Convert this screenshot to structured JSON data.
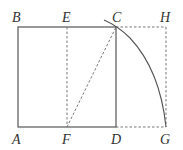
{
  "diagram": {
    "colors": {
      "solid": "#555555",
      "dashed": "#777777",
      "label": "#333333"
    },
    "points": {
      "A": {
        "label": "A",
        "x": 18,
        "y": 127
      },
      "B": {
        "label": "B",
        "x": 18,
        "y": 27
      },
      "C": {
        "label": "C",
        "x": 116,
        "y": 27
      },
      "D": {
        "label": "D",
        "x": 116,
        "y": 127
      },
      "E": {
        "label": "E",
        "x": 67,
        "y": 27
      },
      "F": {
        "label": "F",
        "x": 67,
        "y": 127
      },
      "G": {
        "label": "G",
        "x": 166,
        "y": 127
      },
      "H": {
        "label": "H",
        "x": 166,
        "y": 27
      }
    },
    "segments_solid": [
      "AB",
      "BC",
      "CD",
      "DA"
    ],
    "segments_dashed": [
      "EF",
      "FC",
      "CH",
      "HG",
      "DG"
    ],
    "arc": {
      "center": "F",
      "from": "near C",
      "to": "G"
    }
  }
}
